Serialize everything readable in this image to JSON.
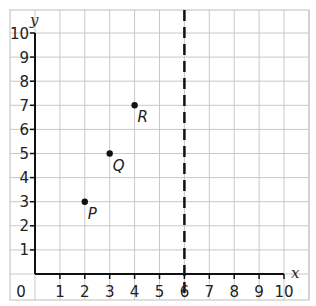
{
  "chart_data": {
    "type": "scatter",
    "title": "",
    "xlabel": "x",
    "ylabel": "y",
    "xlim": [
      0,
      10
    ],
    "ylim": [
      0,
      10
    ],
    "grid": true,
    "x_ticks": [
      1,
      2,
      3,
      4,
      5,
      6,
      7,
      8,
      9,
      10
    ],
    "y_ticks": [
      1,
      2,
      3,
      4,
      5,
      6,
      7,
      8,
      9,
      10
    ],
    "origin_label": "0",
    "points": [
      {
        "label": "P",
        "x": 2,
        "y": 3
      },
      {
        "label": "Q",
        "x": 3,
        "y": 5
      },
      {
        "label": "R",
        "x": 4,
        "y": 7
      }
    ],
    "reference_lines": [
      {
        "type": "vertical",
        "x": 6,
        "style": "dashed",
        "equation": "x = 6"
      }
    ]
  },
  "colors": {
    "grid": "#c8c8c8",
    "axis": "#111111",
    "point": "#111111",
    "dashed_line": "#111111",
    "background": "#ffffff"
  }
}
